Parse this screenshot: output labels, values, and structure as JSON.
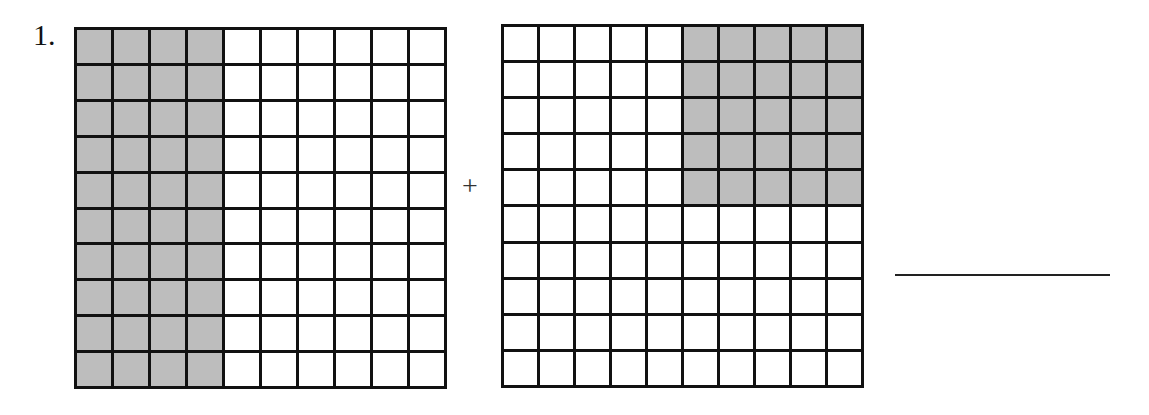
{
  "problem": {
    "number": "1.",
    "operator": "+"
  },
  "grids": [
    {
      "rows": 10,
      "cols": 10,
      "shaded_description": "left 4 columns, all rows",
      "shaded_count": 40
    },
    {
      "rows": 10,
      "cols": 10,
      "shaded_description": "right 5 columns, top 5 rows",
      "shaded_count": 25
    }
  ],
  "answer": {
    "value": ""
  },
  "colors": {
    "shade": "#bdbdbd",
    "line": "#111111"
  }
}
